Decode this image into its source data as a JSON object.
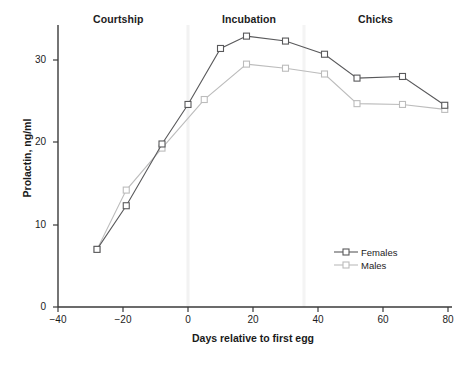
{
  "chart_data": {
    "type": "line",
    "title": "",
    "xlabel": "Days relative to first egg",
    "ylabel": "Prolactin, ng/ml",
    "xlim": [
      -40,
      80
    ],
    "ylim": [
      0,
      34
    ],
    "xticks": [
      -40,
      -20,
      0,
      20,
      40,
      60,
      80
    ],
    "xtick_labels": [
      "−40",
      "−20",
      "0",
      "20",
      "40",
      "60",
      "80"
    ],
    "yticks": [
      0,
      10,
      20,
      30
    ],
    "ytick_labels": [
      "0",
      "10",
      "20",
      "30"
    ],
    "grid": false,
    "legend_position": "lower-right",
    "series": [
      {
        "name": "Females",
        "color": "#59595b",
        "marker": "open-square",
        "x": [
          -28,
          -19,
          -8,
          0,
          10,
          18,
          30,
          42,
          52,
          66,
          79
        ],
        "y": [
          7.0,
          12.3,
          19.8,
          24.6,
          31.4,
          32.9,
          32.3,
          30.7,
          27.8,
          28.0,
          24.5
        ]
      },
      {
        "name": "Males",
        "color": "#bcbcbc",
        "marker": "open-square",
        "x": [
          -28,
          -19,
          -8,
          5,
          18,
          30,
          42,
          52,
          66,
          79
        ],
        "y": [
          7.0,
          14.2,
          19.3,
          25.2,
          29.5,
          29.0,
          28.3,
          24.7,
          24.6,
          24.0
        ]
      }
    ],
    "annotations": [
      {
        "text": "Courtship",
        "x": -14,
        "role": "phase-label"
      },
      {
        "text": "Incubation",
        "x": 25,
        "role": "phase-label"
      },
      {
        "text": "Chicks",
        "x": 66,
        "role": "phase-label"
      }
    ]
  },
  "axes": {
    "y_title": "Prolactin, ng/ml",
    "x_title": "Days relative to first egg",
    "y_tick_labels": [
      "30",
      "20",
      "10",
      "0"
    ],
    "x_tick_labels": [
      "−40",
      "−20",
      "0",
      "20",
      "40",
      "60",
      "80"
    ]
  },
  "phases": {
    "courtship": "Courtship",
    "incubation": "Incubation",
    "chicks": "Chicks"
  },
  "legend": {
    "females": "Females",
    "males": "Males"
  },
  "colors": {
    "females": "#59595b",
    "males": "#bcbcbc",
    "axis": "#3a3a3a",
    "background": "#ffffff"
  },
  "edge_artifact": {
    "col": "|||"
  }
}
